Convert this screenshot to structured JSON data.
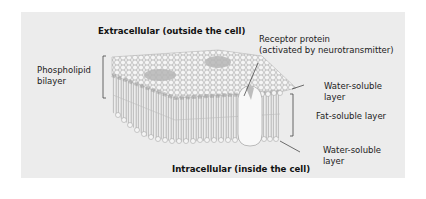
{
  "diagram": {
    "type": "cell-membrane-cross-section",
    "colors": {
      "background": "#ffffff",
      "panel": "#ececec",
      "lipid_head": "#f4f4f4",
      "lipid_outline": "#9a9a9a",
      "tail": "#8a8a8a",
      "protein": "#f7f7f7",
      "embedded_protein": "#b9b9b9",
      "leader_line": "#333333"
    }
  },
  "labels": {
    "top_title": "Extracellular (outside the cell)",
    "bottom_title": "Intracellular (inside the cell)",
    "phospholipid_line1": "Phospholipid",
    "phospholipid_line2": "bilayer",
    "receptor_line1": "Receptor protein",
    "receptor_line2": "(activated by neurotransmitter)",
    "water_top_line1": "Water-soluble",
    "water_top_line2": "layer",
    "fat_layer": "Fat-soluble layer",
    "water_bottom_line1": "Water-soluble",
    "water_bottom_line2": "layer"
  }
}
